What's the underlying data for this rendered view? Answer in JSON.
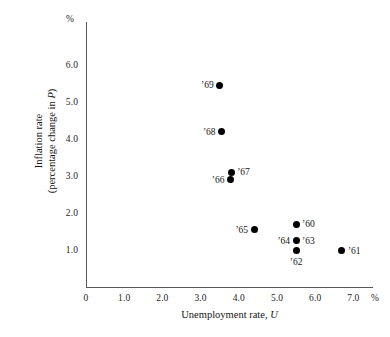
{
  "chart_data": {
    "type": "scatter",
    "title": "",
    "xlabel": "Unemployment rate, U",
    "xlabel_text": "Unemployment rate, ",
    "xlabel_var": "U",
    "ylabel_line1": "Inflation rate",
    "ylabel_line2": "(percentage change in P)",
    "ylabel_line2_pre": "(percentage change in ",
    "ylabel_line2_var": "P",
    "ylabel_line2_post": ")",
    "x_unit": "%",
    "y_unit": "%",
    "xlim": [
      0,
      7.6
    ],
    "ylim": [
      0,
      6.6
    ],
    "grid": false,
    "legend": "none",
    "x_ticks": [
      "0",
      "1.0",
      "2.0",
      "3.0",
      "4.0",
      "5.0",
      "6.0",
      "7.0"
    ],
    "x_tick_values": [
      0,
      1.0,
      2.0,
      3.0,
      4.0,
      5.0,
      6.0,
      7.0
    ],
    "y_ticks": [
      "1.0",
      "2.0",
      "3.0",
      "4.0",
      "5.0",
      "6.0"
    ],
    "y_tick_values": [
      1.0,
      2.0,
      3.0,
      4.0,
      5.0,
      6.0
    ],
    "marker_color": "#000000",
    "axis_color": "#555759",
    "points": [
      {
        "label": "’69",
        "x": 3.5,
        "y": 5.45,
        "label_pos": "left"
      },
      {
        "label": "’68",
        "x": 3.55,
        "y": 4.2,
        "label_pos": "left"
      },
      {
        "label": "’67",
        "x": 3.8,
        "y": 3.1,
        "label_pos": "right"
      },
      {
        "label": "’66",
        "x": 3.78,
        "y": 2.9,
        "label_pos": "left"
      },
      {
        "label": "’65",
        "x": 4.4,
        "y": 1.55,
        "label_pos": "left"
      },
      {
        "label": "’60",
        "x": 5.5,
        "y": 1.7,
        "label_pos": "right"
      },
      {
        "label": "’64",
        "x": 5.5,
        "y": 1.25,
        "label_pos": "left"
      },
      {
        "label": "’63",
        "x": 5.5,
        "y": 1.25,
        "label_pos": "right"
      },
      {
        "label": "’62",
        "x": 5.5,
        "y": 0.98,
        "label_pos": "below"
      },
      {
        "label": "’61",
        "x": 6.7,
        "y": 0.98,
        "label_pos": "right"
      }
    ]
  }
}
